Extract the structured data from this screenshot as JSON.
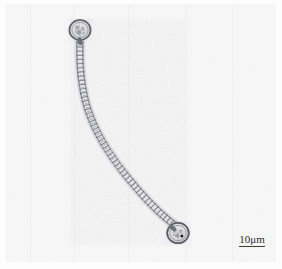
{
  "figure": {
    "kind": "light-micrograph",
    "caption_text": "",
    "background_color": "#fdfdfd",
    "panel": {
      "x": 0,
      "y": 0,
      "width": 282,
      "height": 269
    }
  },
  "scalebar": {
    "label": "10μm",
    "value": 10,
    "unit": "μm",
    "bar_length_px": 26,
    "line_color": "#3a3a3a",
    "text_color": "#2c2c2c",
    "position": {
      "x": 226,
      "y": 233
    }
  },
  "specimen": {
    "name": "filamentous-cyanobacterium",
    "description": "curved chain of rectangular vegetative cells terminated by two rounded heterocysts",
    "stroke_color": "#6e6e74",
    "fill_color": "#d8d8dc",
    "filament": {
      "cell_count": 46,
      "width_px": 7,
      "path": [
        [
          80,
          40
        ],
        [
          79,
          62
        ],
        [
          80,
          84
        ],
        [
          86,
          106
        ],
        [
          96,
          128
        ],
        [
          109,
          150
        ],
        [
          125,
          172
        ],
        [
          145,
          196
        ],
        [
          165,
          215
        ],
        [
          176,
          224
        ]
      ]
    },
    "heterocysts": [
      {
        "id": "top-heterocyst",
        "cx": 80,
        "cy": 30,
        "rx": 11,
        "ry": 10
      },
      {
        "id": "bottom-heterocyst",
        "cx": 178,
        "cy": 233,
        "rx": 11,
        "ry": 10
      }
    ]
  }
}
